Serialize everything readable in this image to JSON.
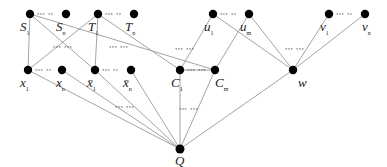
{
  "diagram": {
    "type": "reduction-graph",
    "edge_color": "#9a9a9a",
    "node_color": "#000000",
    "nodes": [
      {
        "id": "S1",
        "label": "S",
        "sub": "1",
        "x": 30,
        "y": 14,
        "lx": 20,
        "ly": 20
      },
      {
        "id": "Sn",
        "label": "S",
        "sub": "n",
        "x": 66,
        "y": 14,
        "lx": 56,
        "ly": 20
      },
      {
        "id": "T1",
        "label": "T",
        "sub": "1",
        "x": 98,
        "y": 14,
        "lx": 88,
        "ly": 20
      },
      {
        "id": "Tn",
        "label": "T",
        "sub": "n",
        "x": 134,
        "y": 14,
        "lx": 125,
        "ly": 20
      },
      {
        "id": "u1",
        "label": "u",
        "sub": "1",
        "x": 213,
        "y": 14,
        "lx": 204,
        "ly": 20
      },
      {
        "id": "um",
        "label": "u",
        "sub": "m",
        "x": 249,
        "y": 14,
        "lx": 240,
        "ly": 20
      },
      {
        "id": "v1",
        "label": "v",
        "sub": "1",
        "x": 329,
        "y": 14,
        "lx": 320,
        "ly": 20
      },
      {
        "id": "vn",
        "label": "v",
        "sub": "n",
        "x": 365,
        "y": 14,
        "lx": 362,
        "ly": 20
      },
      {
        "id": "x1",
        "label": "x",
        "sub": "1",
        "x": 28,
        "y": 70,
        "lx": 20,
        "ly": 76
      },
      {
        "id": "xn",
        "label": "x",
        "sub": "n",
        "x": 62,
        "y": 70,
        "lx": 56,
        "ly": 76
      },
      {
        "id": "xb1",
        "label": "x̄",
        "sub": "1",
        "x": 95,
        "y": 70,
        "lx": 87,
        "ly": 76
      },
      {
        "id": "xbn",
        "label": "x̄",
        "sub": "n",
        "x": 131,
        "y": 70,
        "lx": 123,
        "ly": 76
      },
      {
        "id": "C1",
        "label": "C",
        "sub": "1",
        "x": 180,
        "y": 70,
        "lx": 171,
        "ly": 76
      },
      {
        "id": "Cm",
        "label": "C",
        "sub": "m",
        "x": 215,
        "y": 70,
        "lx": 215,
        "ly": 76
      },
      {
        "id": "w",
        "label": "w",
        "sub": "",
        "x": 293,
        "y": 70,
        "lx": 298,
        "ly": 76
      },
      {
        "id": "Q",
        "label": "Q",
        "sub": "",
        "x": 180,
        "y": 149,
        "lx": 175,
        "ly": 154
      }
    ],
    "edges": [
      [
        "S1",
        "x1"
      ],
      [
        "S1",
        "xb1"
      ],
      [
        "S1",
        "Cm"
      ],
      [
        "T1",
        "x1"
      ],
      [
        "T1",
        "xb1"
      ],
      [
        "T1",
        "C1"
      ],
      [
        "u1",
        "C1"
      ],
      [
        "u1",
        "w"
      ],
      [
        "um",
        "Cm"
      ],
      [
        "um",
        "w"
      ],
      [
        "v1",
        "w"
      ],
      [
        "vn",
        "w"
      ],
      [
        "x1",
        "Q"
      ],
      [
        "xn",
        "Q"
      ],
      [
        "xb1",
        "Q"
      ],
      [
        "xbn",
        "Q"
      ],
      [
        "C1",
        "Q"
      ],
      [
        "Cm",
        "Q"
      ],
      [
        "w",
        "Q"
      ],
      [
        "C1",
        "Cm"
      ]
    ],
    "ellipses": [
      {
        "text": "··· ··",
        "x": 37,
        "y": 11
      },
      {
        "text": "··· ··",
        "x": 105,
        "y": 11
      },
      {
        "text": "··· ··",
        "x": 220,
        "y": 11
      },
      {
        "text": "··· ··",
        "x": 336,
        "y": 11
      },
      {
        "text": "··· ··",
        "x": 35,
        "y": 67
      },
      {
        "text": "··· ··",
        "x": 102,
        "y": 67
      },
      {
        "text": "··· ···",
        "x": 187,
        "y": 67
      },
      {
        "text": "··· ···",
        "x": 53,
        "y": 44
      },
      {
        "text": "··· ···",
        "x": 109,
        "y": 44
      },
      {
        "text": "··· ···",
        "x": 175,
        "y": 46
      },
      {
        "text": "··· ···",
        "x": 285,
        "y": 46
      },
      {
        "text": "··· ···",
        "x": 115,
        "y": 104
      },
      {
        "text": "··· ···",
        "x": 179,
        "y": 106
      }
    ]
  }
}
